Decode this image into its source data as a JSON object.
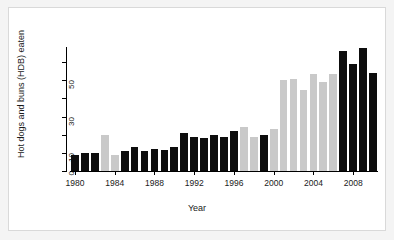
{
  "figure": {
    "background_color": "#f4f4f4",
    "canvas_color": "#ffffff",
    "frame_color": "#d9d9d9"
  },
  "axes": {
    "y_title": "Hot dogs and buns (HDB) eaten",
    "x_title": "Year",
    "y_tick_values": [
      0,
      10,
      20,
      30,
      40,
      50,
      60
    ],
    "y_tick_labels": [
      "0",
      "10",
      "",
      "30",
      "",
      "50",
      ""
    ],
    "x_tick_labels": [
      "1980",
      "1984",
      "1988",
      "1992",
      "1996",
      "2000",
      "2004",
      "2008"
    ]
  },
  "colors": {
    "series_a": "#0d0d0d",
    "series_b": "#c9c9c9",
    "axis": "#000000",
    "text": "#1a1a1a"
  },
  "chart_data": {
    "type": "bar",
    "title": "",
    "xlabel": "Year",
    "ylabel": "Hot dogs and buns (HDB) eaten",
    "xlim": [
      1979.5,
      2010.5
    ],
    "ylim": [
      0,
      70
    ],
    "grid": false,
    "legend": "none",
    "categories": [
      "1980",
      "1981",
      "1982",
      "1983",
      "1984",
      "1985",
      "1986",
      "1987",
      "1988",
      "1989",
      "1990",
      "1991",
      "1992",
      "1993",
      "1994",
      "1995",
      "1996",
      "1997",
      "1998",
      "1999",
      "2000",
      "2001",
      "2002",
      "2003",
      "2004",
      "2005",
      "2006",
      "2007",
      "2008",
      "2009",
      "2010"
    ],
    "values": [
      9,
      10,
      10,
      20,
      9,
      11,
      13,
      11,
      12,
      11.5,
      13.5,
      21,
      19,
      18,
      20,
      19,
      22,
      24.5,
      19,
      20,
      23,
      50,
      50.5,
      44.5,
      53.5,
      49,
      53.5,
      66,
      59,
      68,
      54
    ],
    "bar_colors": [
      "#0d0d0d",
      "#0d0d0d",
      "#0d0d0d",
      "#c9c9c9",
      "#c9c9c9",
      "#0d0d0d",
      "#0d0d0d",
      "#0d0d0d",
      "#0d0d0d",
      "#0d0d0d",
      "#0d0d0d",
      "#0d0d0d",
      "#0d0d0d",
      "#0d0d0d",
      "#0d0d0d",
      "#0d0d0d",
      "#0d0d0d",
      "#c9c9c9",
      "#c9c9c9",
      "#0d0d0d",
      "#c9c9c9",
      "#c9c9c9",
      "#c9c9c9",
      "#c9c9c9",
      "#c9c9c9",
      "#c9c9c9",
      "#c9c9c9",
      "#0d0d0d",
      "#0d0d0d",
      "#0d0d0d",
      "#0d0d0d"
    ]
  }
}
